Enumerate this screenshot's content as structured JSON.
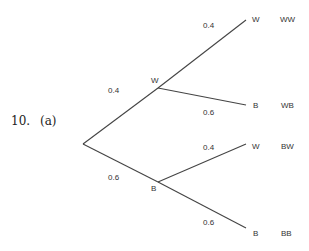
{
  "question": {
    "number": "10.",
    "part": "(a)"
  },
  "tree": {
    "root": {
      "x": 83,
      "y": 144
    },
    "level1": [
      {
        "label": "W",
        "prob": "0.4",
        "x": 158,
        "y": 88
      },
      {
        "label": "B",
        "prob": "0.6",
        "x": 158,
        "y": 182
      }
    ],
    "level2": [
      {
        "parent": "W",
        "label": "W",
        "prob": "0.4",
        "outcome": "WW"
      },
      {
        "parent": "W",
        "label": "B",
        "prob": "0.6",
        "outcome": "WB"
      },
      {
        "parent": "B",
        "label": "W",
        "prob": "0.4",
        "outcome": "BW"
      },
      {
        "parent": "B",
        "label": "B",
        "prob": "0.6",
        "outcome": "BB"
      }
    ]
  },
  "colors": {
    "line": "#444444",
    "text": "#333333"
  }
}
